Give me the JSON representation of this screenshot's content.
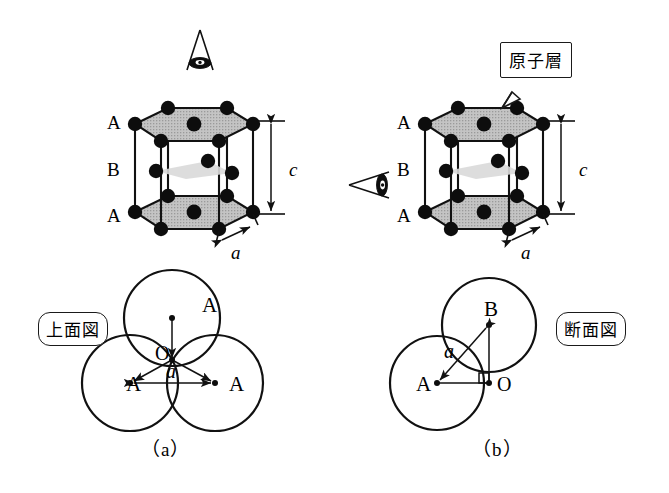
{
  "figure": {
    "title_alt": "HCP crystal structure figure",
    "captions": {
      "left": "（a）",
      "right": "（b）"
    }
  },
  "panel_a": {
    "name": "top-view-panel",
    "caption": "（a）",
    "view_label": "上面図",
    "view_label_meaning": "top view",
    "eye_icon": "eye-looking-down-icon",
    "prism": {
      "layer_labels": [
        "A",
        "B",
        "A"
      ],
      "height_label": "c",
      "edge_label": "a"
    },
    "spheres": [
      {
        "label": "A",
        "position": "top"
      },
      {
        "label": "A",
        "position": "bottom-left"
      },
      {
        "label": "A",
        "position": "bottom-right"
      }
    ],
    "center_label": "O",
    "distance_label": "a"
  },
  "panel_b": {
    "name": "cross-section-panel",
    "caption": "（b）",
    "view_label": "断面図",
    "view_label_meaning": "cross-section view",
    "eye_icon": "eye-looking-sideways-icon",
    "callout_label": "原子層",
    "callout_meaning": "atomic layer",
    "prism": {
      "layer_labels": [
        "A",
        "B",
        "A"
      ],
      "height_label": "c",
      "edge_label": "a"
    },
    "spheres": [
      {
        "label": "B",
        "position": "upper-right"
      },
      {
        "label": "A",
        "position": "lower-left"
      }
    ],
    "point_label": "O",
    "distance_label": "a",
    "right_angle_marker": true
  },
  "colors": {
    "atom": "#0d0d0d",
    "edge": "#111111",
    "face_top": "#b8b8b8",
    "face_mid": "#d6d6d6",
    "background": "#ffffff"
  }
}
